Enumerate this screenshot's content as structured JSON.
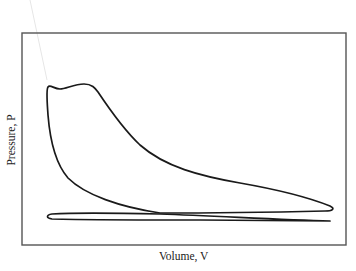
{
  "diagram": {
    "type": "pressure-volume indicator diagram",
    "xlabel": "Volume, V",
    "ylabel": "Pressure, P",
    "frame": {
      "x1": 22,
      "y1": 33,
      "x2": 346,
      "y2": 245
    },
    "colors": {
      "frame": "#555555",
      "curve": "#1a1a1a",
      "text": "#222222"
    },
    "loops": [
      {
        "name": "power-loop",
        "description": "Large loop: compression rise, peak-pressure plateau, expansion curve down to bottom-dead-centre tip"
      },
      {
        "name": "pumping-loop",
        "description": "Thin low-pressure loop spanning full stroke near the bottom"
      }
    ]
  }
}
